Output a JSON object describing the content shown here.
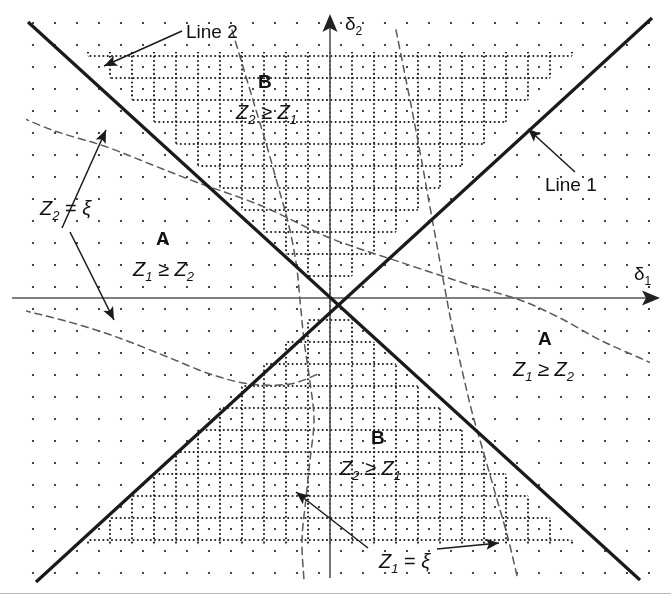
{
  "figure": {
    "width": 671,
    "height": 601,
    "background": "#ffffff",
    "ink_color": "#1a1a1a",
    "axis_color": "#555555",
    "dash_color": "#5a5a5a"
  },
  "axes": {
    "x_label": "δ",
    "x_label_sub": "1",
    "y_label": "δ",
    "y_label_sub": "2",
    "origin": {
      "x": 330,
      "y": 298
    },
    "x_axis": {
      "x1": 12,
      "y1": 298,
      "x2": 660,
      "y2": 298,
      "arrow": "right"
    },
    "y_axis": {
      "x1": 330,
      "y1": 578,
      "x2": 330,
      "y2": 14,
      "arrow": "up"
    }
  },
  "lines": [
    {
      "name": "Line 1",
      "label": "Line 1",
      "label_x": 545,
      "label_y": 175,
      "slope": -1,
      "description": "solid line through origin rising to the right (delta2 = delta1)",
      "p1": {
        "x": 36,
        "y": 582
      },
      "p2": {
        "x": 652,
        "y": 18
      },
      "pointer_from": {
        "x": 575,
        "y": 172
      },
      "pointer_to": {
        "x": 528,
        "y": 129
      }
    },
    {
      "name": "Line 2",
      "label": "Line 2",
      "label_x": 186,
      "label_y": 22,
      "slope": 1,
      "description": "solid line through origin falling to the right (delta2 = -delta1)",
      "p1": {
        "x": 28,
        "y": 22
      },
      "p2": {
        "x": 640,
        "y": 580
      },
      "pointer_from": {
        "x": 182,
        "y": 31
      },
      "pointer_to": {
        "x": 104,
        "y": 66
      }
    }
  ],
  "regions": [
    {
      "id": "left-A",
      "label": "A",
      "relation_lhs": "Z",
      "relation_lhs_sub": "1",
      "relation_op": " ≥ ",
      "relation_rhs": "Z",
      "relation_rhs_sub": "2",
      "label_x": 156,
      "label_y": 229,
      "relation_x": 133,
      "relation_y": 259,
      "fill": "sparse-dots"
    },
    {
      "id": "right-A",
      "label": "A",
      "relation_lhs": "Z",
      "relation_lhs_sub": "1",
      "relation_op": " ≥ ",
      "relation_rhs": "Z",
      "relation_rhs_sub": "2",
      "label_x": 538,
      "label_y": 329,
      "relation_x": 513,
      "relation_y": 359,
      "fill": "sparse-dots"
    },
    {
      "id": "top-B",
      "label": "B",
      "relation_lhs": "Z",
      "relation_lhs_sub": "2",
      "relation_op": " ≥ ",
      "relation_rhs": "Z",
      "relation_rhs_sub": "1",
      "label_x": 258,
      "label_y": 72,
      "relation_x": 236,
      "relation_y": 102,
      "fill": "crosshatch-grid"
    },
    {
      "id": "bottom-B",
      "label": "B",
      "relation_lhs": "Z",
      "relation_lhs_sub": "2",
      "relation_op": " ≥ ",
      "relation_rhs": "Z",
      "relation_rhs_sub": "1",
      "label_x": 371,
      "label_y": 428,
      "relation_x": 340,
      "relation_y": 458,
      "fill": "crosshatch-grid"
    }
  ],
  "curves": [
    {
      "id": "z2-xi",
      "label_lhs": "Z",
      "label_lhs_sub": "2",
      "label_op": " = ",
      "label_rhs": "ξ",
      "label_x": 40,
      "label_y": 198,
      "style": "dashed",
      "description": "gently descending dashed contour crossing the plane from upper-left to lower-right",
      "points": [
        [
          0,
          108
        ],
        [
          52,
          130
        ],
        [
          104,
          146
        ],
        [
          150,
          164
        ],
        [
          196,
          182
        ],
        [
          262,
          206
        ],
        [
          330,
          238
        ],
        [
          400,
          262
        ],
        [
          470,
          285
        ],
        [
          520,
          300
        ],
        [
          560,
          318
        ],
        [
          600,
          340
        ],
        [
          640,
          358
        ],
        [
          671,
          372
        ]
      ],
      "pointers": [
        {
          "from": {
            "x": 62,
            "y": 228
          },
          "to": {
            "x": 106,
            "y": 130
          }
        },
        {
          "from": {
            "x": 70,
            "y": 232
          },
          "to": {
            "x": 114,
            "y": 320
          }
        }
      ]
    },
    {
      "id": "z2-xi-lower-left",
      "label": "",
      "style": "dashed",
      "description": "continuation of Z2 = xi dashed contour entering at lower left below axis",
      "points": [
        [
          0,
          305
        ],
        [
          30,
          312
        ],
        [
          62,
          320
        ],
        [
          96,
          330
        ],
        [
          130,
          342
        ],
        [
          170,
          358
        ],
        [
          210,
          374
        ],
        [
          250,
          384
        ],
        [
          290,
          384
        ],
        [
          318,
          374
        ]
      ]
    },
    {
      "id": "z1-xi",
      "label_lhs": "Z",
      "label_lhs_sub": "1",
      "label_op": " = ",
      "label_rhs": "ξ",
      "label_x": 379,
      "label_y": 551,
      "style": "dashed",
      "description": "steeply descending dashed contour crossing the plane from top to bottom-left",
      "points": [
        [
          232,
          30
        ],
        [
          244,
          70
        ],
        [
          256,
          110
        ],
        [
          268,
          150
        ],
        [
          278,
          186
        ],
        [
          288,
          222
        ],
        [
          296,
          262
        ],
        [
          300,
          300
        ],
        [
          304,
          340
        ],
        [
          310,
          382
        ],
        [
          314,
          420
        ],
        [
          310,
          460
        ],
        [
          306,
          498
        ],
        [
          302,
          540
        ],
        [
          304,
          580
        ]
      ],
      "pointers": [
        {
          "from": {
            "x": 368,
            "y": 548
          },
          "to": {
            "x": 296,
            "y": 492
          }
        },
        {
          "from": {
            "x": 437,
            "y": 549
          },
          "to": {
            "x": 499,
            "y": 543
          }
        }
      ]
    },
    {
      "id": "z1-xi-right",
      "label": "",
      "style": "dashed",
      "description": "right-hand steep dashed contour branch from upper area down to lower right",
      "points": [
        [
          396,
          30
        ],
        [
          404,
          70
        ],
        [
          412,
          110
        ],
        [
          420,
          152
        ],
        [
          428,
          196
        ],
        [
          436,
          240
        ],
        [
          444,
          284
        ],
        [
          452,
          326
        ],
        [
          462,
          370
        ],
        [
          472,
          412
        ],
        [
          484,
          454
        ],
        [
          496,
          496
        ],
        [
          508,
          538
        ],
        [
          518,
          580
        ]
      ]
    }
  ],
  "patterns": {
    "sparse_dots": {
      "spacing": 22,
      "dot_size": 2.2,
      "color": "#1a1a1a"
    },
    "crosshatch_grid": {
      "spacing": 22,
      "dot_size": 2.1,
      "dot_pitch": 4.3,
      "color": "#1a1a1a"
    }
  }
}
